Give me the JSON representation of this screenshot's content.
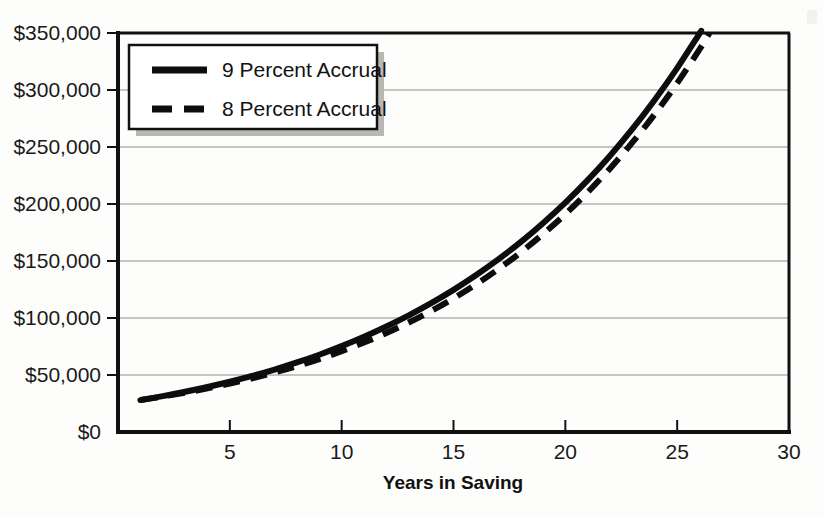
{
  "chart_data": {
    "type": "line",
    "title": "",
    "xlabel": "Years in Saving",
    "ylabel": "",
    "xlim": [
      0,
      30
    ],
    "ylim": [
      0,
      350000
    ],
    "grid": true,
    "legend_position": "top-left",
    "x_ticks": [
      "5",
      "10",
      "15",
      "20",
      "25",
      "30"
    ],
    "x_tick_values": [
      5,
      10,
      15,
      20,
      25,
      30
    ],
    "y_ticks": [
      "$0",
      "$50,000",
      "$100,000",
      "$150,000",
      "$200,000",
      "$250,000",
      "$300,000",
      "$350,000"
    ],
    "y_tick_values": [
      0,
      50000,
      100000,
      150000,
      200000,
      250000,
      300000,
      350000
    ],
    "x": [
      1,
      2,
      3,
      4,
      5,
      6,
      7,
      8,
      9,
      10,
      11,
      12,
      13,
      14,
      15,
      16,
      17,
      18,
      19,
      20,
      21,
      22,
      23,
      24,
      25,
      26,
      27,
      28,
      29,
      30
    ],
    "series": [
      {
        "name": "9 Percent Accrual",
        "style": "solid",
        "color": "#0d0d0d",
        "values": [
          28000,
          31500,
          35300,
          39500,
          44100,
          49200,
          54800,
          61000,
          67800,
          75300,
          83500,
          92500,
          102300,
          113000,
          124700,
          137500,
          151400,
          166600,
          183200,
          201200,
          220900,
          242400,
          265800,
          291400,
          319200,
          349500,
          382500,
          418500,
          457700,
          500500
        ]
      },
      {
        "name": "8 Percent Accrual",
        "style": "dashed",
        "color": "#0d0d0d",
        "values": [
          28000,
          31100,
          34500,
          38300,
          42500,
          47100,
          52200,
          57800,
          64000,
          70900,
          78500,
          86800,
          96000,
          106100,
          117200,
          129400,
          142800,
          157500,
          173600,
          191100,
          210300,
          231200,
          254000,
          278900,
          306000,
          335600,
          367900,
          403100,
          441500,
          483400
        ]
      }
    ],
    "legend": [
      {
        "label": "9 Percent Accrual",
        "style": "solid"
      },
      {
        "label": "8 Percent Accrual",
        "style": "dashed"
      }
    ]
  }
}
